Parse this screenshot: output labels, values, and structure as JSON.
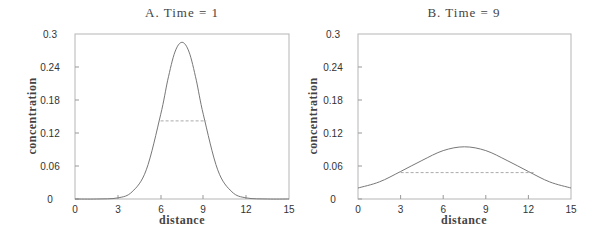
{
  "chart_data": [
    {
      "type": "line",
      "title": "A.   Time  =  1",
      "xlabel": "distance",
      "ylabel": "concentration",
      "xlim": [
        0,
        15
      ],
      "ylim": [
        0,
        0.3
      ],
      "xticks": [
        "0",
        "3",
        "6",
        "9",
        "12",
        "15"
      ],
      "yticks": [
        "0",
        "0.06",
        "0.12",
        "0.18",
        "0.24",
        "0.3"
      ],
      "grid": false,
      "series": [
        {
          "name": "concentration profile",
          "style": "solid",
          "note": "values read from plot; smooth bell-shaped curve, approximately Gaussian",
          "x": [
            0,
            1.5,
            3,
            4,
            5,
            6,
            6.5,
            7,
            7.5,
            8,
            8.5,
            9,
            10,
            11,
            12,
            13.5,
            15
          ],
          "y": [
            0,
            0,
            0.002,
            0.013,
            0.053,
            0.153,
            0.216,
            0.267,
            0.285,
            0.267,
            0.216,
            0.153,
            0.053,
            0.013,
            0.002,
            0,
            0
          ]
        },
        {
          "name": "half-width marker",
          "style": "dashed",
          "x": [
            6,
            9.2
          ],
          "y": [
            0.142,
            0.142
          ]
        }
      ]
    },
    {
      "type": "line",
      "title": "B.   Time  =  9",
      "xlabel": "distance",
      "ylabel": "concentration",
      "xlim": [
        0,
        15
      ],
      "ylim": [
        0,
        0.3
      ],
      "xticks": [
        "0",
        "3",
        "6",
        "9",
        "12",
        "15"
      ],
      "yticks": [
        "0",
        "0.06",
        "0.12",
        "0.18",
        "0.24",
        "0.3"
      ],
      "grid": false,
      "series": [
        {
          "name": "concentration profile",
          "style": "solid",
          "note": "values read from plot; broad bell-shaped curve, approximately Gaussian",
          "x": [
            0,
            1.5,
            3,
            4.5,
            6,
            7.5,
            9,
            10.5,
            12,
            13.5,
            15
          ],
          "y": [
            0.02,
            0.031,
            0.05,
            0.07,
            0.088,
            0.095,
            0.088,
            0.07,
            0.05,
            0.031,
            0.02
          ]
        },
        {
          "name": "half-width marker",
          "style": "dashed",
          "x": [
            3,
            12.5
          ],
          "y": [
            0.048,
            0.048
          ]
        }
      ]
    }
  ],
  "panels": [
    {
      "title": "A.   Time  =  1",
      "xlabel": "distance",
      "ylabel": "concentration"
    },
    {
      "title": "B.   Time  =  9",
      "xlabel": "distance",
      "ylabel": "concentration"
    }
  ],
  "colors": {
    "axis": "#aaaaaa",
    "curve": "#777777",
    "dash": "#aaaaaa",
    "text": "#333333"
  }
}
